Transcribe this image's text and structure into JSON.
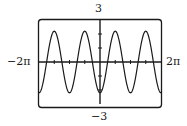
{
  "chart_data": {
    "type": "line",
    "title": "",
    "xlabel": "",
    "ylabel": "",
    "xlim_label": [
      "−2π",
      "2π"
    ],
    "ylim_label": [
      "−3",
      "3"
    ],
    "xlim": [
      -6.2832,
      6.2832
    ],
    "ylim": [
      -3,
      3
    ],
    "x_tick_step": 1.5708,
    "y_tick_step": 1,
    "grid": false,
    "legend": null,
    "series": [
      {
        "name": "y ≈ −2.2·cos(2x)",
        "function": "-2.2*cos(2x)",
        "amplitude": 2.2,
        "period": 3.1416,
        "x": [
          -6.2832,
          -4.7124,
          -3.1416,
          -1.5708,
          0,
          1.5708,
          3.1416,
          4.7124,
          6.2832
        ],
        "y": [
          -2.2,
          2.2,
          -2.2,
          2.2,
          -2.2,
          2.2,
          -2.2,
          2.2,
          -2.2
        ]
      }
    ]
  },
  "labels": {
    "y_max": "3",
    "y_min": "−3",
    "x_min": "−2π",
    "x_max": "2π"
  },
  "colors": {
    "curve": "#1a1a1a",
    "axes": "#1a1a1a",
    "frame": "#1a1a1a",
    "background": "#ffffff"
  }
}
